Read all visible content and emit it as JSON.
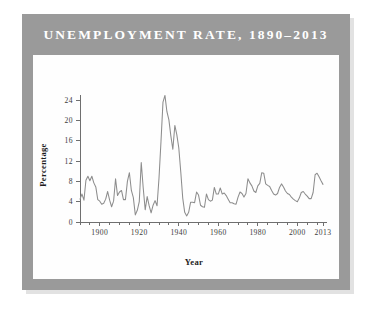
{
  "figure": {
    "title": "UNEMPLOYMENT RATE, 1890–2013",
    "frame_color": "#9a9a9a",
    "card_color": "#fefefe",
    "line_color": "#8d8d8d",
    "axis_color": "#6f6f6f",
    "title_color": "#ffffff"
  },
  "chart_data": {
    "type": "line",
    "title": "UNEMPLOYMENT RATE, 1890–2013",
    "xlabel": "Year",
    "ylabel": "Percentage",
    "xlim": [
      1890,
      2013
    ],
    "ylim": [
      0,
      24
    ],
    "grid": false,
    "legend": false,
    "xticks": [
      1900,
      1920,
      1940,
      1960,
      1980,
      2000,
      2013
    ],
    "xtick_labels": [
      "1900",
      "1920",
      "1940",
      "1960",
      "1980",
      "2000",
      "2013"
    ],
    "xtick_minor_step": 5,
    "yticks": [
      0,
      4,
      8,
      12,
      16,
      20,
      24
    ],
    "ytick_labels": [
      "0",
      "4",
      "8",
      "12",
      "16",
      "20",
      "24"
    ],
    "series": [
      {
        "name": "Unemployment Rate",
        "color": "#8d8d8d",
        "x": [
          1890,
          1891,
          1892,
          1893,
          1894,
          1895,
          1896,
          1897,
          1898,
          1899,
          1900,
          1901,
          1902,
          1903,
          1904,
          1905,
          1906,
          1907,
          1908,
          1909,
          1910,
          1911,
          1912,
          1913,
          1914,
          1915,
          1916,
          1917,
          1918,
          1919,
          1920,
          1921,
          1922,
          1923,
          1924,
          1925,
          1926,
          1927,
          1928,
          1929,
          1930,
          1931,
          1932,
          1933,
          1934,
          1935,
          1936,
          1937,
          1938,
          1939,
          1940,
          1941,
          1942,
          1943,
          1944,
          1945,
          1946,
          1947,
          1948,
          1949,
          1950,
          1951,
          1952,
          1953,
          1954,
          1955,
          1956,
          1957,
          1958,
          1959,
          1960,
          1961,
          1962,
          1963,
          1964,
          1965,
          1966,
          1967,
          1968,
          1969,
          1970,
          1971,
          1972,
          1973,
          1974,
          1975,
          1976,
          1977,
          1978,
          1979,
          1980,
          1981,
          1982,
          1983,
          1984,
          1985,
          1986,
          1987,
          1988,
          1989,
          1990,
          1991,
          1992,
          1993,
          1994,
          1995,
          1996,
          1997,
          1998,
          1999,
          2000,
          2001,
          2002,
          2003,
          2004,
          2005,
          2006,
          2007,
          2008,
          2009,
          2010,
          2011,
          2012,
          2013
        ],
        "values": [
          4.5,
          5.5,
          4.3,
          8.2,
          9.0,
          8.1,
          9.0,
          7.7,
          6.9,
          4.4,
          4.1,
          3.5,
          3.7,
          4.5,
          6.0,
          4.3,
          3.0,
          4.1,
          8.5,
          5.2,
          5.9,
          6.2,
          4.4,
          4.4,
          8.0,
          9.7,
          6.2,
          4.8,
          1.4,
          2.3,
          4.0,
          11.7,
          6.7,
          2.4,
          5.0,
          3.2,
          1.8,
          3.3,
          4.2,
          3.2,
          8.7,
          15.9,
          23.6,
          24.9,
          21.7,
          20.1,
          16.9,
          14.3,
          19.0,
          17.2,
          14.6,
          9.9,
          4.7,
          1.9,
          1.2,
          1.9,
          3.9,
          3.9,
          3.8,
          5.9,
          5.3,
          3.3,
          3.0,
          2.9,
          5.5,
          4.4,
          4.1,
          4.3,
          6.8,
          5.5,
          5.5,
          6.7,
          5.5,
          5.7,
          5.2,
          4.5,
          3.8,
          3.8,
          3.6,
          3.5,
          4.9,
          5.9,
          5.6,
          4.9,
          5.6,
          8.5,
          7.7,
          7.1,
          6.1,
          5.8,
          7.1,
          7.6,
          9.7,
          9.6,
          7.5,
          7.2,
          7.0,
          6.2,
          5.5,
          5.3,
          5.6,
          6.8,
          7.5,
          6.9,
          6.1,
          5.6,
          5.4,
          4.9,
          4.5,
          4.2,
          4.0,
          4.7,
          5.8,
          6.0,
          5.5,
          5.1,
          4.6,
          4.6,
          5.8,
          9.3,
          9.6,
          8.9,
          8.1,
          7.4
        ]
      }
    ]
  }
}
